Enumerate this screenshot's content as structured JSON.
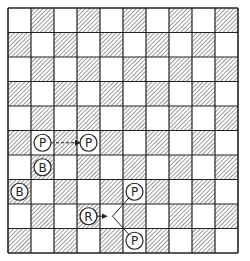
{
  "diagram": {
    "type": "chess-board-diagram",
    "board": {
      "columns": 10,
      "rows": 10,
      "origin": [
        8,
        8
      ],
      "cell_width": 23,
      "cell_height": 24.5,
      "light_square": "white",
      "dark_square": "hatched",
      "line_color": "#222222",
      "hatch_color": "#555555"
    },
    "pieces": [
      {
        "id": "pawn-1",
        "label": "P",
        "name": "pawn",
        "col": 1,
        "row": 5
      },
      {
        "id": "pawn-2",
        "label": "P",
        "name": "pawn",
        "col": 3,
        "row": 5
      },
      {
        "id": "bishop-1",
        "label": "B",
        "name": "bishop",
        "col": 1,
        "row": 6
      },
      {
        "id": "bishop-2",
        "label": "B",
        "name": "bishop",
        "col": 0,
        "row": 7
      },
      {
        "id": "rook-1",
        "label": "R",
        "name": "rook",
        "col": 3,
        "row": 8
      },
      {
        "id": "pawn-3",
        "label": "P",
        "name": "pawn",
        "col": 5,
        "row": 7
      },
      {
        "id": "pawn-4",
        "label": "P",
        "name": "pawn",
        "col": 5,
        "row": 9
      }
    ],
    "arrows": [
      {
        "from": "pawn-1",
        "to": "pawn-2",
        "style": "dashed"
      },
      {
        "from": "rook-1",
        "to": "fork",
        "style": "solid"
      },
      {
        "from": "fork",
        "to": "pawn-3",
        "style": "solid"
      },
      {
        "from": "fork",
        "to": "pawn-4",
        "style": "solid"
      }
    ]
  }
}
